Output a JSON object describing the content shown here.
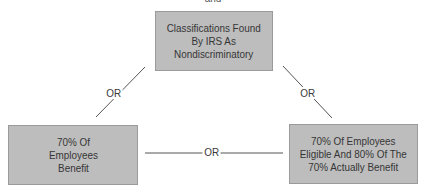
{
  "diagram": {
    "top_caption": "and",
    "nodes": {
      "top": {
        "lines": [
          "Classifications Found",
          "By IRS As",
          "Nondiscriminatory"
        ]
      },
      "left": {
        "lines": [
          "70% Of",
          "Employees",
          "Benefit"
        ]
      },
      "right": {
        "lines": [
          "70% Of Employees",
          "Eligible And 80% Of The",
          "70% Actually Benefit"
        ]
      }
    },
    "edges": [
      {
        "from": "top",
        "to": "left",
        "label": "OR"
      },
      {
        "from": "top",
        "to": "right",
        "label": "OR"
      },
      {
        "from": "left",
        "to": "right",
        "label": "OR"
      }
    ],
    "colors": {
      "box_fill": "#bdbdbd",
      "box_border": "#9a9a9a",
      "line": "#555555",
      "text": "#363636"
    }
  }
}
